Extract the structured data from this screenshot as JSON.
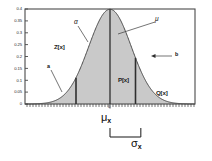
{
  "chart_data": {
    "type": "area",
    "title": "",
    "xlabel": "",
    "ylabel": "",
    "grid": false,
    "legend": null,
    "ylim": [
      0,
      0.4
    ],
    "xlim": [
      -4,
      4
    ],
    "y_ticks": [
      "0",
      "0.05",
      "0.1",
      "0.15",
      "0.2",
      "0.25",
      "0.3",
      "0.35",
      "0.4"
    ],
    "y_tick_values": [
      0,
      0.05,
      0.1,
      0.15,
      0.2,
      0.25,
      0.3,
      0.35,
      0.4
    ],
    "x_ticks": [
      "0"
    ],
    "x_tick_values": [
      0
    ],
    "series": [
      {
        "name": "standard-normal-pdf",
        "kind": "gaussian",
        "mean": 0,
        "sigma": 1,
        "peak": 0.4,
        "fill": "#c9c9c9",
        "stroke": "#4a4a4a",
        "x": [
          -4,
          -3.5,
          -3,
          -2.5,
          -2,
          -1.5,
          -1,
          -0.5,
          0,
          0.5,
          1,
          1.5,
          2,
          2.5,
          3,
          3.5,
          4
        ],
        "values": [
          0.0001,
          0.0009,
          0.0044,
          0.0175,
          0.054,
          0.1295,
          0.242,
          0.3521,
          0.3989,
          0.3521,
          0.242,
          0.1295,
          0.054,
          0.0175,
          0.0044,
          0.0009,
          0.0001
        ]
      }
    ],
    "vertical_lines": [
      {
        "name": "a-line",
        "x": -1.6,
        "label": "a"
      },
      {
        "name": "mu-line",
        "x": 0,
        "label": "mu"
      },
      {
        "name": "b-line",
        "x": 1.2,
        "label": "b"
      }
    ],
    "region_labels": [
      {
        "name": "Z",
        "text": "Z[x]",
        "x": -2.35,
        "y": 0.21
      },
      {
        "name": "P",
        "text": "P[x]",
        "x": 0.62,
        "y": 0.088
      },
      {
        "name": "Q",
        "text": "Q[x]",
        "x": 1.72,
        "y": 0.032
      }
    ],
    "annotations": [
      {
        "name": "alpha",
        "text": "α",
        "target_x": -0.95,
        "target_y": 0.3
      },
      {
        "name": "mu",
        "text": "μ",
        "target_x": 0.38,
        "target_y": 0.315
      },
      {
        "name": "a",
        "text": "a",
        "target_x": -1.6,
        "target_y": 0.098
      },
      {
        "name": "b",
        "text": "b",
        "target_x": 1.2,
        "target_y": 0.215
      }
    ],
    "axis_annotations": {
      "mean_label": "μ",
      "mean_subscript": "x",
      "sigma_label": "σ",
      "sigma_subscript": "x",
      "bracket_from_x": 0,
      "bracket_to_x": 1.45
    },
    "colors": {
      "fill": "#c9c9c9",
      "curve": "#4a4a4a",
      "frame": "#4a4a4a",
      "text": "#111111",
      "background": "#ffffff"
    }
  }
}
